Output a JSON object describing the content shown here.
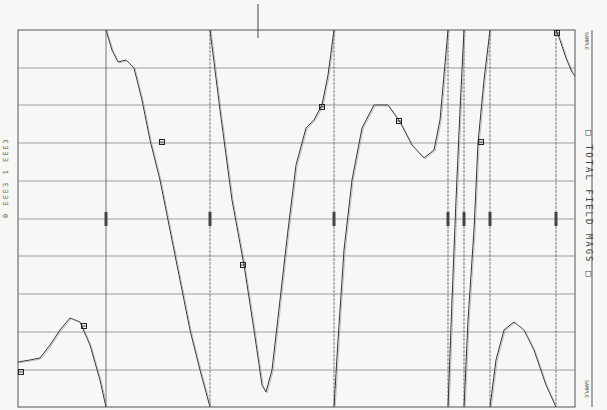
{
  "chart_data": {
    "type": "line",
    "title": "TOTAL FIELD MAGS",
    "legend": {
      "label": "TOTAL FIELD MAGS",
      "position": "right, rotated 90deg"
    },
    "left_annotation": "0 EEE3  1  EEE3",
    "orientation": "rotated strip chart (profile plotted with wrap-around segments)",
    "grid": true,
    "frame": {
      "x0": 18,
      "x1": 575,
      "y0": 30,
      "y1": 407
    },
    "horizontal_gridlines_px": [
      68,
      105,
      143,
      181,
      219,
      256,
      294,
      332,
      370
    ],
    "vertical_wrap_lines_px": [
      106,
      210,
      334,
      448,
      464,
      490,
      556
    ],
    "top_tick_px": 258,
    "corner_labels": {
      "top_right": "SAMPLE",
      "bottom_right": "SAMPLE",
      "mid_right": "SAMPLE"
    },
    "series": [
      {
        "name": "total-field-profile",
        "segments": [
          [
            [
              18,
              362
            ],
            [
              30,
              360
            ],
            [
              40,
              358
            ],
            [
              50,
              345
            ],
            [
              60,
              330
            ],
            [
              70,
              318
            ],
            [
              80,
              322
            ],
            [
              90,
              345
            ],
            [
              100,
              380
            ],
            [
              106,
              407
            ]
          ],
          [
            [
              106,
              30
            ],
            [
              112,
              50
            ],
            [
              118,
              62
            ],
            [
              126,
              60
            ],
            [
              134,
              68
            ],
            [
              142,
              100
            ],
            [
              150,
              140
            ],
            [
              160,
              180
            ],
            [
              170,
              230
            ],
            [
              180,
              280
            ],
            [
              190,
              330
            ],
            [
              200,
              370
            ],
            [
              210,
              407
            ]
          ],
          [
            [
              210,
              30
            ],
            [
              220,
              110
            ],
            [
              232,
              200
            ],
            [
              244,
              265
            ],
            [
              254,
              330
            ],
            [
              262,
              385
            ],
            [
              266,
              392
            ],
            [
              272,
              370
            ],
            [
              280,
              300
            ],
            [
              288,
              230
            ],
            [
              296,
              165
            ],
            [
              306,
              128
            ],
            [
              314,
              120
            ],
            [
              322,
              105
            ],
            [
              328,
              75
            ],
            [
              334,
              30
            ]
          ],
          [
            [
              334,
              407
            ],
            [
              338,
              340
            ],
            [
              344,
              250
            ],
            [
              352,
              180
            ],
            [
              362,
              128
            ],
            [
              374,
              105
            ],
            [
              388,
              105
            ],
            [
              400,
              122
            ],
            [
              412,
              145
            ],
            [
              424,
              158
            ],
            [
              434,
              150
            ],
            [
              440,
              120
            ],
            [
              448,
              30
            ]
          ],
          [
            [
              448,
              407
            ],
            [
              452,
              300
            ],
            [
              456,
              200
            ],
            [
              460,
              110
            ],
            [
              464,
              30
            ]
          ],
          [
            [
              464,
              407
            ],
            [
              468,
              320
            ],
            [
              474,
              230
            ],
            [
              478,
              143
            ],
            [
              484,
              80
            ],
            [
              490,
              30
            ]
          ],
          [
            [
              490,
              407
            ],
            [
              496,
              360
            ],
            [
              504,
              330
            ],
            [
              514,
              322
            ],
            [
              524,
              330
            ],
            [
              534,
              350
            ],
            [
              546,
              385
            ],
            [
              556,
              407
            ]
          ],
          [
            [
              556,
              30
            ],
            [
              560,
              40
            ],
            [
              566,
              58
            ],
            [
              572,
              72
            ],
            [
              575,
              76
            ]
          ]
        ],
        "markers_px": [
          [
            84,
            326
          ],
          [
            162,
            142
          ],
          [
            243,
            265
          ],
          [
            322,
            107
          ],
          [
            399,
            121
          ],
          [
            481,
            142
          ],
          [
            557,
            33
          ],
          [
            21,
            372
          ]
        ]
      }
    ]
  }
}
